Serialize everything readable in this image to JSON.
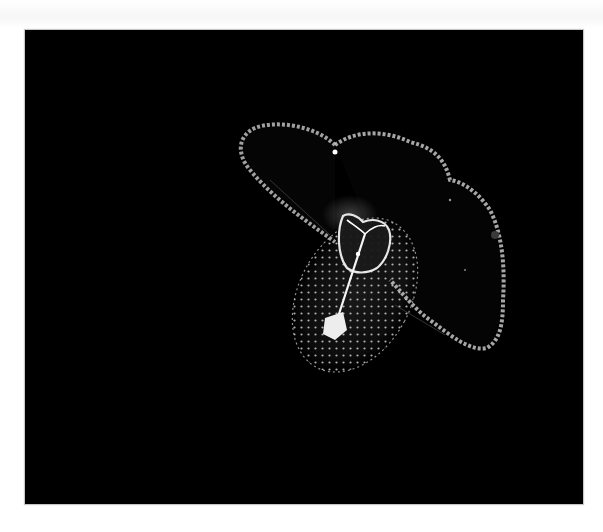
{
  "photo": {
    "subject": "bioluminescent planktonic larva",
    "description": "glowing translucent larva with a broad lobed velum and an oval dotted body on a black background",
    "background_color": "#000000",
    "glow_color": "#e8e8e8",
    "frame": {
      "left": 25,
      "top": 30,
      "width": 558,
      "height": 474
    }
  }
}
